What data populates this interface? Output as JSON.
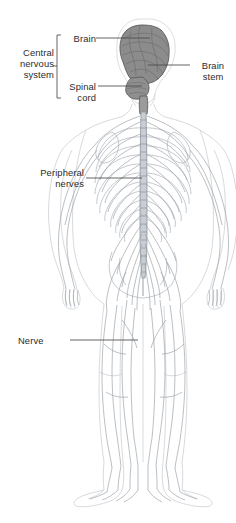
{
  "diagram": {
    "colors": {
      "text": "#2b2b2b",
      "leader_line": "#4a4a4a",
      "bracket": "#4a4a4a",
      "brain_fill": "#8c8c8c",
      "brain_stroke": "#5a5a5a",
      "body_outline": "#d8dade",
      "nerve_line": "#9aa0a6",
      "spinal_cord": "#8e949a",
      "background": "#ffffff"
    },
    "labels": [
      {
        "id": "central-nervous-system",
        "text": "Central\nnervous\nsystem",
        "align": "right",
        "has_bracket": true,
        "bracket_groups": [
          "brain",
          "spinal-cord"
        ]
      },
      {
        "id": "brain",
        "text": "Brain",
        "align": "right",
        "leader": "horizontal-right"
      },
      {
        "id": "spinal-cord",
        "text": "Spinal\ncord",
        "align": "right",
        "leader": "horizontal-right"
      },
      {
        "id": "brain-stem",
        "text": "Brain\nstem",
        "align": "center",
        "leader": "horizontal-left"
      },
      {
        "id": "peripheral-nerves",
        "text": "Peripheral\nnerves",
        "align": "right",
        "leader": "horizontal-right"
      },
      {
        "id": "nerve",
        "text": "Nerve",
        "align": "left",
        "leader": "horizontal-right"
      }
    ]
  }
}
